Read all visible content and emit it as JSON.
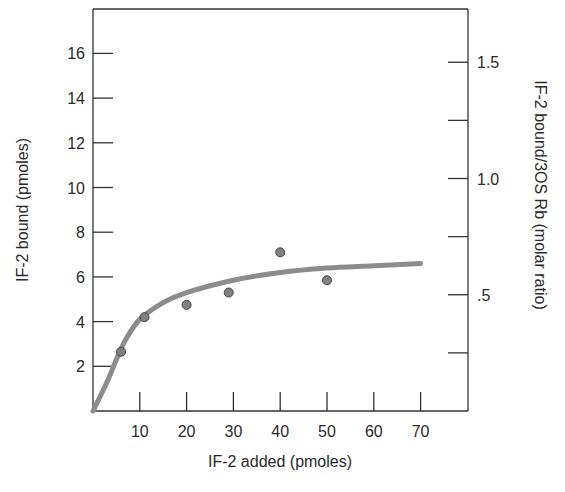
{
  "chart_data": {
    "type": "scatter",
    "title": "",
    "xlabel": "IF-2 added (pmoles)",
    "ylabel": "IF-2 bound (pmoles)",
    "y2label": "IF-2 bound/3OS Rb (molar ratio)",
    "xlim": [
      0,
      75
    ],
    "ylim": [
      0,
      17.5
    ],
    "x_ticks": [
      10,
      20,
      30,
      40,
      50,
      60,
      70
    ],
    "x_tick_labels": [
      "10",
      "20",
      "30",
      "40",
      "50",
      "60",
      "70"
    ],
    "y_ticks": [
      2,
      4,
      6,
      8,
      10,
      12,
      14,
      16
    ],
    "y_tick_labels": [
      "2",
      "4",
      "6",
      "8",
      "10",
      "12",
      "14",
      "16"
    ],
    "y2_ticks": [
      0.25,
      0.5,
      0.75,
      1.0,
      1.25,
      1.5
    ],
    "y2_tick_labels": [
      "",
      ".5",
      "",
      "1.0",
      "",
      "1.5"
    ],
    "grid": false,
    "legend": null,
    "series": [
      {
        "name": "Measured IF-2 bound",
        "kind": "points",
        "x": [
          6,
          11,
          20,
          29,
          40,
          50
        ],
        "y": [
          2.65,
          4.2,
          4.75,
          5.3,
          7.1,
          5.85
        ]
      },
      {
        "name": "Fitted saturation curve",
        "kind": "line",
        "x": [
          0,
          3,
          5,
          7,
          10,
          15,
          20,
          30,
          40,
          50,
          60,
          70
        ],
        "y": [
          0,
          1.3,
          2.3,
          3.2,
          4.1,
          4.85,
          5.3,
          5.85,
          6.2,
          6.4,
          6.5,
          6.6
        ]
      }
    ],
    "colors": {
      "points": "#808080",
      "curve": "#8c8c8c",
      "axes": "#333333"
    }
  }
}
